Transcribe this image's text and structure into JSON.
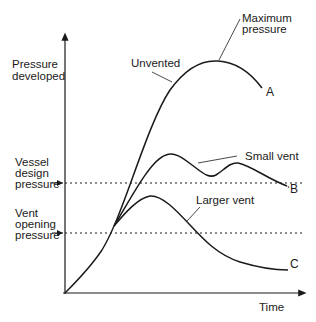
{
  "diagram": {
    "title": "",
    "y_axis_label_line1": "Pressure",
    "y_axis_label_line2": "developed",
    "x_axis_label": "Time",
    "reference_lines": {
      "vessel_design": {
        "line1": "Vessel",
        "line2": "design",
        "line3": "pressure"
      },
      "vent_opening": {
        "line1": "Vent",
        "line2": "opening",
        "line3": "pressure"
      }
    },
    "curves": {
      "unvented": {
        "label": "Unvented",
        "end_letter": "A"
      },
      "small_vent": {
        "label": "Small vent",
        "end_letter": "B"
      },
      "larger_vent": {
        "label": "Larger vent",
        "end_letter": "C"
      }
    },
    "annotations": {
      "max_line1": "Maximum",
      "max_line2": "pressure"
    }
  },
  "colors": {
    "ink": "#1a1a1a",
    "background": "#ffffff"
  }
}
